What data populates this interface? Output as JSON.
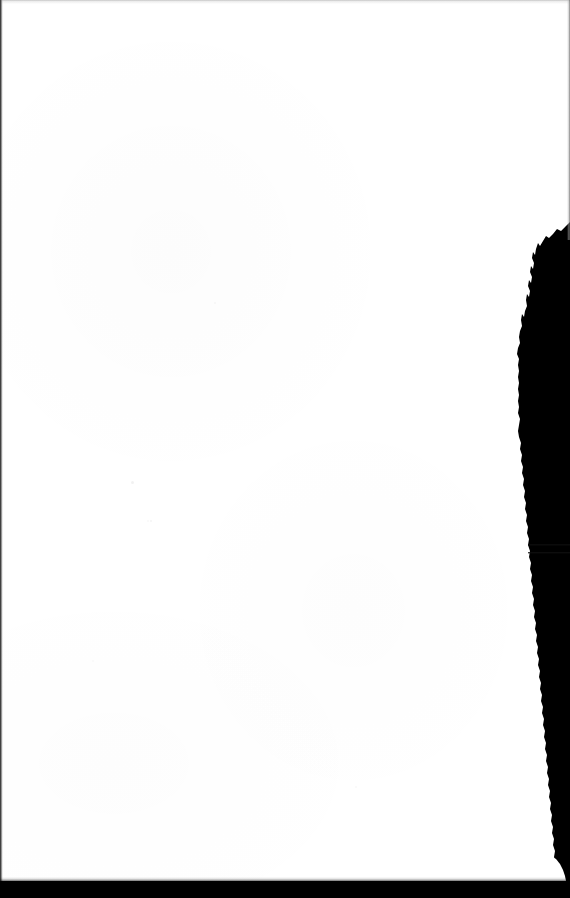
{
  "document": {
    "kind": "scanned-page-image",
    "page_label": "",
    "body_text": "",
    "orientation": "portrait",
    "width_px": 570,
    "height_px": 898
  },
  "canvas": {
    "background_color": "#ffffff",
    "ink_color": "#000000"
  },
  "artifacts": {
    "top_edge": {
      "name": "top-scan-edge",
      "color": "#969696",
      "thickness_px": 2
    },
    "left_edge": {
      "name": "left-scan-edge",
      "color": "#2b2b2b",
      "thickness_px": 2
    },
    "right_edge_hairline": {
      "name": "right-scan-hairline",
      "color": "#5a5a5a",
      "thickness_px": 2,
      "extends_to_y": 240
    },
    "torn_shadow": {
      "name": "right-torn-shadow",
      "color": "#000000",
      "starts_y": 225,
      "widest_x": 518,
      "description": "dark torn page edge along right margin"
    },
    "bottom_bar": {
      "name": "bottom-scan-bar",
      "color": "#000000",
      "height_px": 17,
      "starts_y": 881
    },
    "corner_notch": {
      "name": "bottom-right-notch",
      "color": "#ffffff",
      "description": "white wedge where page corner lifts"
    }
  }
}
